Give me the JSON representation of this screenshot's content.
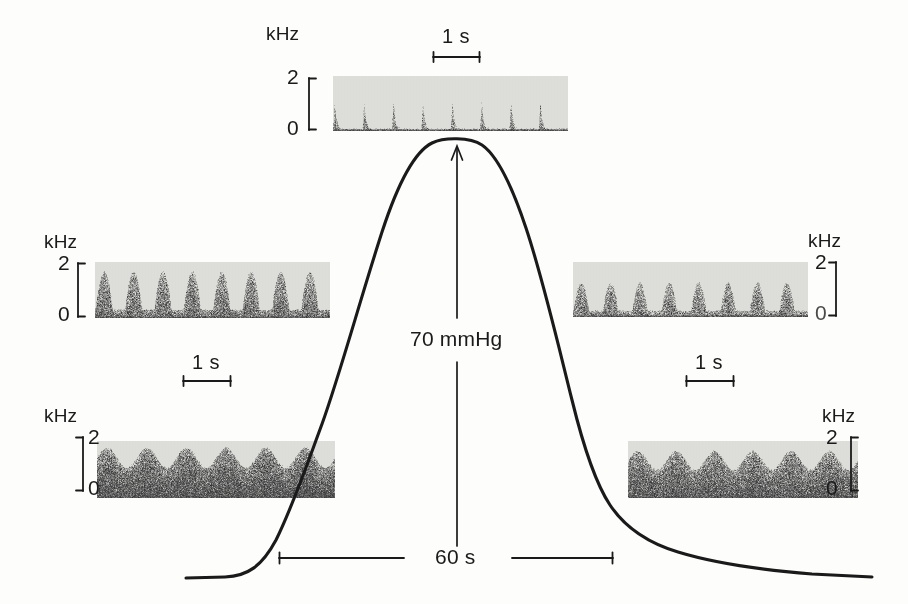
{
  "figure": {
    "background_color": "#fdfdfb",
    "ink_color": "#1a1a1a",
    "pressure_annotation": "70 mmHg",
    "time_scale_main": "60 s",
    "axis_unit": "kHz",
    "tick_high": "2",
    "tick_low": "0",
    "time_scale_short": "1 s"
  },
  "panels": [
    {
      "id": "top",
      "position": "top-center",
      "axis_unit": "kHz",
      "tick_high": "2",
      "tick_low": "0",
      "scale_label": "1 s",
      "description": "peak-pressure burst discharge",
      "bursts": 8,
      "pattern": "spike",
      "duty": 0.3,
      "fill_fraction": 0.55,
      "density": 0.52
    },
    {
      "id": "left-middle",
      "position": "middle-left",
      "axis_unit": "kHz",
      "tick_high": "2",
      "tick_low": "0",
      "scale_label": "1 s",
      "description": "rising-phase pulsatile discharge",
      "bursts": 8,
      "pattern": "hump",
      "duty": 0.62,
      "fill_fraction": 0.82,
      "density": 0.62
    },
    {
      "id": "right-middle",
      "position": "middle-right",
      "axis_unit": "kHz",
      "tick_high": "2",
      "tick_low": "0",
      "scale_label": "1 s",
      "description": "falling-phase pulsatile discharge",
      "bursts": 8,
      "pattern": "hump",
      "duty": 0.55,
      "fill_fraction": 0.62,
      "density": 0.55
    },
    {
      "id": "bottom-left",
      "position": "bottom-left",
      "axis_unit": "kHz",
      "tick_high": "2",
      "tick_low": "0",
      "description": "baseline control activity before pressure rise",
      "bursts": 6,
      "pattern": "noise",
      "duty": 0.9,
      "fill_fraction": 0.88,
      "density": 0.78
    },
    {
      "id": "bottom-right",
      "position": "bottom-right",
      "axis_unit": "kHz",
      "tick_high": "2",
      "tick_low": "0",
      "description": "recovery activity after pressure fall",
      "bursts": 6,
      "pattern": "noise",
      "duty": 0.9,
      "fill_fraction": 0.82,
      "density": 0.74
    }
  ],
  "chart_data": {
    "type": "line",
    "title": "",
    "xlabel": "",
    "ylabel": "",
    "annotations": [
      {
        "text": "70 mmHg",
        "kind": "vertical-double-arrow",
        "value": 70
      },
      {
        "text": "60 s",
        "kind": "horizontal-scale-bar",
        "value": 60
      }
    ],
    "series": [
      {
        "name": "arterial pressure",
        "x": [
          0,
          4,
          8,
          12,
          16,
          20,
          24,
          28,
          32,
          36,
          40,
          44,
          48,
          52,
          56,
          60,
          64,
          68,
          72,
          76,
          80,
          84,
          88,
          92,
          96,
          100
        ],
        "y": [
          0,
          0,
          0,
          1,
          3,
          9,
          22,
          42,
          62,
          80,
          93,
          99,
          100,
          98,
          92,
          80,
          62,
          42,
          26,
          16,
          10,
          7,
          5,
          4,
          3,
          2
        ]
      }
    ],
    "ylim": [
      0,
      100
    ],
    "grid": false,
    "legend": false
  }
}
